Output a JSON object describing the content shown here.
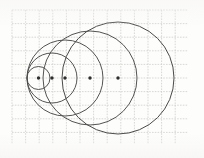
{
  "figure": {
    "medium": "pencil on graph paper",
    "paper_color": "#fdfdfc",
    "grid_color": "#c9c9c4",
    "ink_color": "#3a3a3a",
    "dot_color": "#2e2e2e"
  },
  "grid": {
    "x0": 12,
    "y0": 10,
    "x1": 188,
    "y1": 144,
    "cell": 13.6,
    "columns": 13,
    "rows": 10,
    "stroke_width": 0.7,
    "dash": "1.6 1.2"
  },
  "axis": {
    "y": 78,
    "x_start": 26,
    "x_end": 176,
    "visible": false
  },
  "chart_data": {
    "type": "scatter",
    "xlabel": "",
    "ylabel": "",
    "xlim": [
      12,
      188
    ],
    "ylim": [
      10,
      144
    ],
    "grid": true,
    "legend": "none",
    "tangent_point_x": 27,
    "shared_center_y": 78,
    "series": [
      {
        "name": "circle-1",
        "cx": 38.5,
        "cy": 78,
        "r": 11.5,
        "stroke": "#4a4a48",
        "stroke_width": 0.95,
        "center_dot": true
      },
      {
        "name": "circle-2",
        "cx": 52.0,
        "cy": 78,
        "r": 25.0,
        "stroke": "#4a4a48",
        "stroke_width": 0.95,
        "center_dot": true
      },
      {
        "name": "circle-3",
        "cx": 65.0,
        "cy": 78,
        "r": 38.0,
        "stroke": "#4a4a48",
        "stroke_width": 0.95,
        "center_dot": true
      },
      {
        "name": "circle-4",
        "cx": 90.0,
        "cy": 78,
        "r": 47.0,
        "stroke": "#4a4a48",
        "stroke_width": 0.95,
        "center_dot": true
      },
      {
        "name": "circle-5",
        "cx": 118.0,
        "cy": 78,
        "r": 56.0,
        "stroke": "#4a4a48",
        "stroke_width": 1.0,
        "center_dot": true
      }
    ],
    "center_dots": [
      {
        "x": 38.5,
        "y": 78,
        "r": 1.7
      },
      {
        "x": 52.0,
        "y": 78,
        "r": 1.7
      },
      {
        "x": 65.0,
        "y": 78,
        "r": 1.7
      },
      {
        "x": 90.0,
        "y": 78,
        "r": 1.7
      },
      {
        "x": 118.0,
        "y": 78,
        "r": 1.7
      }
    ]
  }
}
